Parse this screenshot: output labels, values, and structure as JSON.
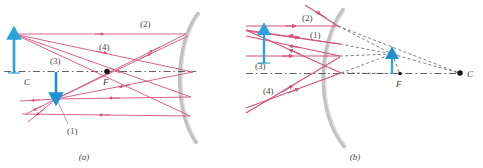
{
  "figure": {
    "panels": [
      {
        "id": "a",
        "caption": "(a)",
        "description": "Object beyond center of curvature; real inverted image between C and F",
        "point_labels": {
          "center": "C",
          "focus": "F"
        },
        "ray_labels": [
          "(1)",
          "(2)",
          "(3)",
          "(4)"
        ],
        "object": {
          "name": "object-arrow",
          "direction": "up",
          "color": "#29a3dc"
        },
        "image": {
          "name": "image-arrow",
          "direction": "down",
          "color": "#1f90d0"
        },
        "mirror": {
          "name": "concave-mirror",
          "color": "#b9b9b9"
        }
      },
      {
        "id": "b",
        "caption": "(b)",
        "description": "Object inside focal point; virtual upright image behind mirror",
        "point_labels": {
          "center": "C",
          "focus": "F"
        },
        "ray_labels": [
          "(1)",
          "(2)",
          "(3)",
          "(4)"
        ],
        "object": {
          "name": "object-arrow",
          "direction": "up",
          "color": "#29a3dc"
        },
        "image": {
          "name": "image-arrow",
          "direction": "up",
          "color": "#35a8e0"
        },
        "mirror": {
          "name": "concave-mirror",
          "color": "#b9b9b9"
        }
      }
    ],
    "colors": {
      "ray": "#d4517f",
      "ray_alt": "#cc4b7c",
      "axis": "#3a3a3a",
      "virtual_ray": "#4a4a4a",
      "mirror": "#c2c2c2",
      "object": "#29a3dc",
      "image": "#1f90d0",
      "background": "#ffffff"
    }
  }
}
